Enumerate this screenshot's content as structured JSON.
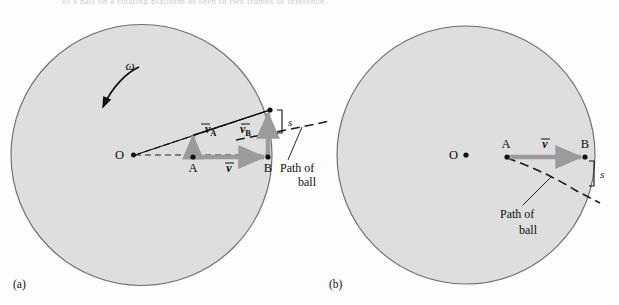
{
  "figure": {
    "caption_fragment": "of a ball on a rotating platform as seen in two frames of reference.",
    "background_color": "#fdfdfd",
    "disk_fill_color": "#dedede",
    "disk_stroke_color": "#6e6e70",
    "vector_color": "#9b9b9b",
    "ink_color": "#100f0f"
  },
  "panels": [
    {
      "id": "a",
      "label": "(a)",
      "center_label": "O",
      "omega_label": "ω",
      "points": [
        {
          "name": "O",
          "label": "O"
        },
        {
          "name": "A",
          "label": "A"
        },
        {
          "name": "B",
          "label": "B"
        }
      ],
      "vectors": [
        {
          "name": "v-A",
          "symbol": "v",
          "subscript": "A",
          "direction": "up",
          "magnitude_px": 22
        },
        {
          "name": "v-B",
          "symbol": "v",
          "subscript": "B",
          "direction": "up",
          "magnitude_px": 45
        },
        {
          "name": "v",
          "symbol": "v",
          "subscript": "",
          "direction": "right",
          "magnitude_px": 75
        }
      ],
      "deflection_label": "s",
      "path_label_line1": "Path of",
      "path_label_line2": "ball"
    },
    {
      "id": "b",
      "label": "(b)",
      "center_label": "O",
      "points": [
        {
          "name": "O",
          "label": "O"
        },
        {
          "name": "A",
          "label": "A"
        },
        {
          "name": "B",
          "label": "B"
        }
      ],
      "vectors": [
        {
          "name": "v",
          "symbol": "v",
          "subscript": "",
          "direction": "right",
          "magnitude_px": 78
        }
      ],
      "deflection_label": "s",
      "path_label_line1": "Path of",
      "path_label_line2": "ball"
    }
  ]
}
